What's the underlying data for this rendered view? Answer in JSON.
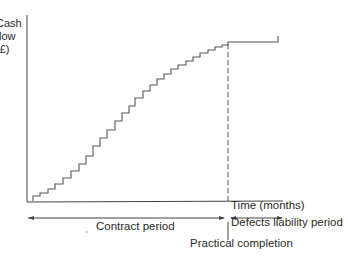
{
  "chart_data": {
    "type": "line",
    "title": "",
    "ylabel": "Cash flow (£)",
    "ylabel_lines": [
      "Cash",
      "flow",
      "(£)"
    ],
    "xlabel": "Time (months)",
    "steps": [
      [
        33,
        201
      ],
      [
        33,
        196
      ],
      [
        40,
        196
      ],
      [
        40,
        193
      ],
      [
        48,
        193
      ],
      [
        48,
        189
      ],
      [
        55,
        189
      ],
      [
        55,
        184
      ],
      [
        63,
        184
      ],
      [
        63,
        178
      ],
      [
        71,
        178
      ],
      [
        71,
        171
      ],
      [
        79,
        171
      ],
      [
        79,
        164
      ],
      [
        86,
        164
      ],
      [
        86,
        156
      ],
      [
        93,
        156
      ],
      [
        93,
        146
      ],
      [
        100,
        146
      ],
      [
        100,
        138
      ],
      [
        107,
        138
      ],
      [
        107,
        130
      ],
      [
        115,
        130
      ],
      [
        115,
        121
      ],
      [
        122,
        121
      ],
      [
        122,
        113
      ],
      [
        129,
        113
      ],
      [
        129,
        106
      ],
      [
        135,
        106
      ],
      [
        135,
        98
      ],
      [
        143,
        98
      ],
      [
        143,
        91
      ],
      [
        150,
        91
      ],
      [
        150,
        85
      ],
      [
        157,
        85
      ],
      [
        157,
        79
      ],
      [
        164,
        79
      ],
      [
        164,
        74
      ],
      [
        171,
        74
      ],
      [
        171,
        69
      ],
      [
        178,
        69
      ],
      [
        178,
        65
      ],
      [
        186,
        65
      ],
      [
        186,
        61
      ],
      [
        193,
        61
      ],
      [
        193,
        57
      ],
      [
        200,
        57
      ],
      [
        200,
        53
      ],
      [
        208,
        53
      ],
      [
        208,
        50
      ],
      [
        215,
        50
      ],
      [
        215,
        47
      ],
      [
        222,
        47
      ],
      [
        222,
        45
      ],
      [
        228,
        45
      ],
      [
        228,
        42
      ],
      [
        278,
        42
      ],
      [
        278,
        36
      ]
    ],
    "annotations": [
      "Contract period",
      "Defects liability period",
      "Practical completion"
    ],
    "grid": false
  },
  "labels": {
    "ylabel_line1": "Cash",
    "ylabel_line2": "flow",
    "ylabel_line3": "(£)",
    "xlabel": "Time (months)",
    "contract_period": "Contract period",
    "defects_period": "Defects liability period",
    "practical_completion": "Practical completion"
  }
}
